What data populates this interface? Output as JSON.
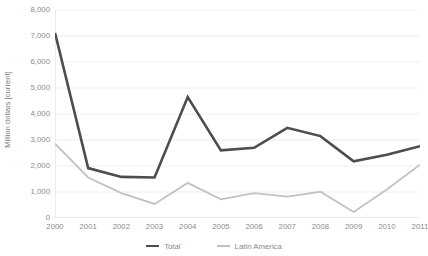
{
  "chart_data": {
    "type": "line",
    "title": "",
    "xlabel": "",
    "ylabel": "Million dollars [current]",
    "categories": [
      "2000",
      "2001",
      "2002",
      "2003",
      "2004",
      "2005",
      "2006",
      "2007",
      "2008",
      "2009",
      "2010",
      "2011"
    ],
    "ylim": [
      0,
      8000
    ],
    "ytick_labels": [
      "8,000",
      "7,000",
      "6,000",
      "5,000",
      "4,000",
      "3,000",
      "2,000",
      "1,000",
      "0"
    ],
    "ytick_values": [
      8000,
      7000,
      6000,
      5000,
      4000,
      3000,
      2000,
      1000,
      0
    ],
    "grid": true,
    "legend_position": "bottom",
    "series": [
      {
        "name": "Total",
        "color": "#4d4d4d",
        "width": 2.6,
        "values": [
          7120,
          1920,
          1580,
          1560,
          4650,
          2600,
          2700,
          3470,
          3150,
          2180,
          2430,
          2760
        ]
      },
      {
        "name": "Latin America",
        "color": "#c2c2c2",
        "width": 1.8,
        "values": [
          2860,
          1560,
          960,
          540,
          1350,
          720,
          960,
          820,
          1010,
          230,
          1100,
          2050
        ]
      }
    ]
  },
  "axis": {
    "y_title": "Million dollars [current]"
  },
  "legend": {
    "items": [
      {
        "label": "Total",
        "color": "#4d4d4d",
        "style": "thick"
      },
      {
        "label": "Latin America",
        "color": "#c2c2c2",
        "style": "thin"
      }
    ]
  },
  "colors": {
    "background": "#ffffff",
    "gridline": "#eeeeee",
    "axis_line": "#d9d9d9",
    "tick_text": "#8a8a8a",
    "total_line": "#4d4d4d",
    "latin_america_line": "#c2c2c2"
  }
}
